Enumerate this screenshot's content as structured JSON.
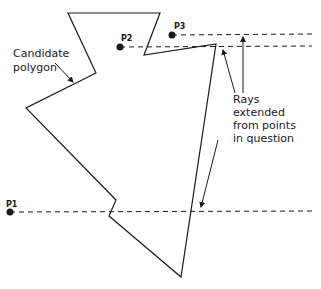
{
  "diagram": {
    "polygon_label_line1": "Candidate",
    "polygon_label_line2": "polygon",
    "rays_label_line1": "Rays",
    "rays_label_line2": "extended",
    "rays_label_line3": "from points",
    "rays_label_line4": "in question",
    "points": [
      {
        "label": "P1",
        "x": 10,
        "y": 212
      },
      {
        "label": "P2",
        "x": 120,
        "y": 47
      },
      {
        "label": "P3",
        "x": 172,
        "y": 35
      }
    ],
    "polygon_vertices": [
      [
        68,
        13
      ],
      [
        160,
        13
      ],
      [
        144,
        55
      ],
      [
        216,
        44
      ],
      [
        181,
        277
      ],
      [
        109,
        216
      ],
      [
        116,
        200
      ],
      [
        26,
        108
      ],
      [
        96,
        73
      ]
    ],
    "colors": {
      "line": "#1a1a1a",
      "background": "#ffffff"
    }
  }
}
